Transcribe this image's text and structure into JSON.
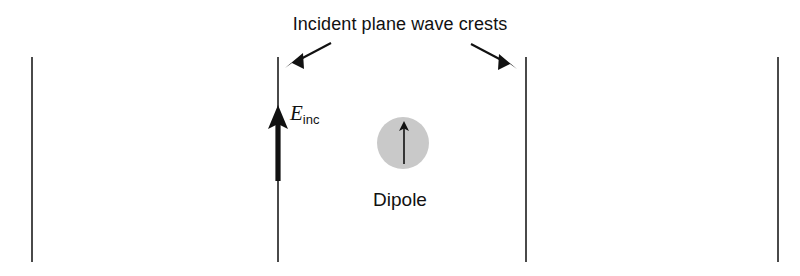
{
  "figure": {
    "title": "Incident plane wave crests",
    "dipole_label": "Dipole",
    "efield_symbol": "E",
    "efield_subscript": "inc",
    "colors": {
      "background": "#ffffff",
      "wave_crest_line": "#4a4a4a",
      "dipole_fill": "#c9c9c9",
      "arrow": "#111111",
      "text": "#111111"
    },
    "wave_crests": [
      {
        "name": "crest-1",
        "x": 31,
        "top": 57,
        "bottom": 262
      },
      {
        "name": "crest-2",
        "x": 277,
        "top": 57,
        "bottom": 262
      },
      {
        "name": "crest-3",
        "x": 525,
        "top": 57,
        "bottom": 262
      },
      {
        "name": "crest-4",
        "x": 777,
        "top": 57,
        "bottom": 262
      }
    ],
    "pointer_arrows": [
      {
        "name": "left-pointer",
        "x1": 330,
        "y1": 44,
        "x2": 288,
        "y2": 66
      },
      {
        "name": "right-pointer",
        "x1": 472,
        "y1": 45,
        "x2": 514,
        "y2": 67
      }
    ],
    "efield_arrow": {
      "x": 277,
      "y_tail": 180,
      "y_tip": 107
    },
    "dipole": {
      "cx": 403,
      "cy": 143,
      "r": 26,
      "arrow_y_tail": 164,
      "arrow_y_tip": 123
    }
  }
}
